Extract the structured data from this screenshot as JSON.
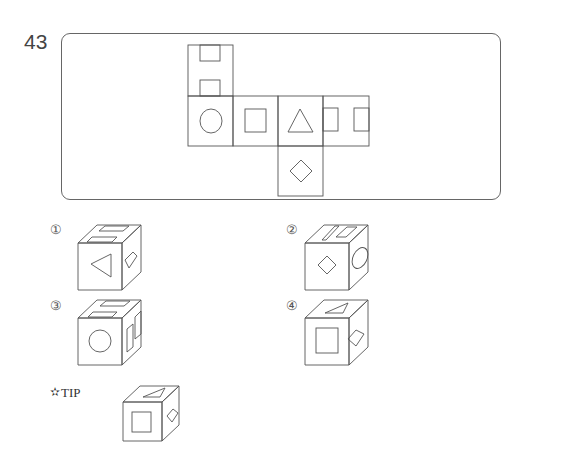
{
  "question": {
    "number": "43",
    "net": {
      "description": "Unfolded cube net",
      "faces": [
        {
          "position": "top",
          "symbol": "two-half-rectangles"
        },
        {
          "position": "left",
          "symbol": "circle"
        },
        {
          "position": "center-left",
          "symbol": "square"
        },
        {
          "position": "center",
          "symbol": "triangle"
        },
        {
          "position": "right",
          "symbol": "two-half-rectangles-vertical"
        },
        {
          "position": "bottom",
          "symbol": "diamond"
        }
      ]
    },
    "options": [
      {
        "label": "①",
        "front": "triangle",
        "top": "two-half-rectangles",
        "side": "diamond"
      },
      {
        "label": "②",
        "front": "diamond",
        "top": "two-half-rectangles",
        "side": "circle"
      },
      {
        "label": "③",
        "front": "circle",
        "top": "two-half-rectangles",
        "side": "two-half-rectangles"
      },
      {
        "label": "④",
        "front": "square",
        "top": "triangle",
        "side": "diamond"
      }
    ],
    "tip": {
      "label": "TIP",
      "icon": "star-pin-icon"
    }
  }
}
